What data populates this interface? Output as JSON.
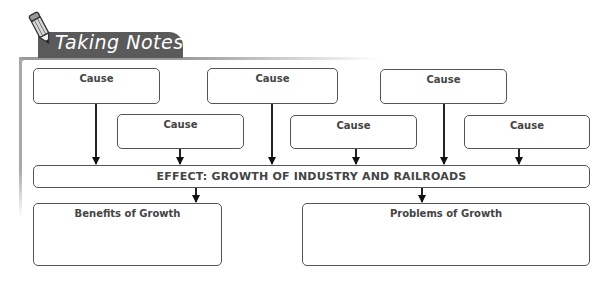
{
  "header": {
    "title": "Taking Notes",
    "icon": "pencil-icon"
  },
  "diagram": {
    "causes_top": [
      {
        "label": "Cause"
      },
      {
        "label": "Cause"
      },
      {
        "label": "Cause"
      }
    ],
    "causes_middle": [
      {
        "label": "Cause"
      },
      {
        "label": "Cause"
      },
      {
        "label": "Cause"
      }
    ],
    "effect": {
      "label": "EFFECT: GROWTH OF INDUSTRY AND RAILROADS"
    },
    "outcomes": [
      {
        "label": "Benefits of Growth"
      },
      {
        "label": "Problems of Growth"
      }
    ]
  },
  "colors": {
    "tab_background": "#5a5a5a",
    "tab_text": "#ffffff",
    "box_border": "#555555",
    "arrow": "#111111"
  }
}
